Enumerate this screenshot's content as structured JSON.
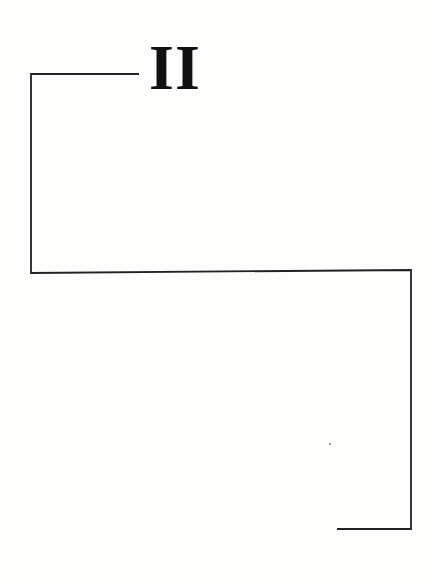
{
  "page": {
    "heading": "II",
    "line_color": "#222222",
    "background": "#fdfdfc"
  },
  "bracket_path": {
    "points": [
      [
        139,
        74
      ],
      [
        31,
        74
      ],
      [
        31,
        273
      ],
      [
        411,
        270
      ],
      [
        411,
        529
      ],
      [
        337,
        529
      ]
    ]
  }
}
